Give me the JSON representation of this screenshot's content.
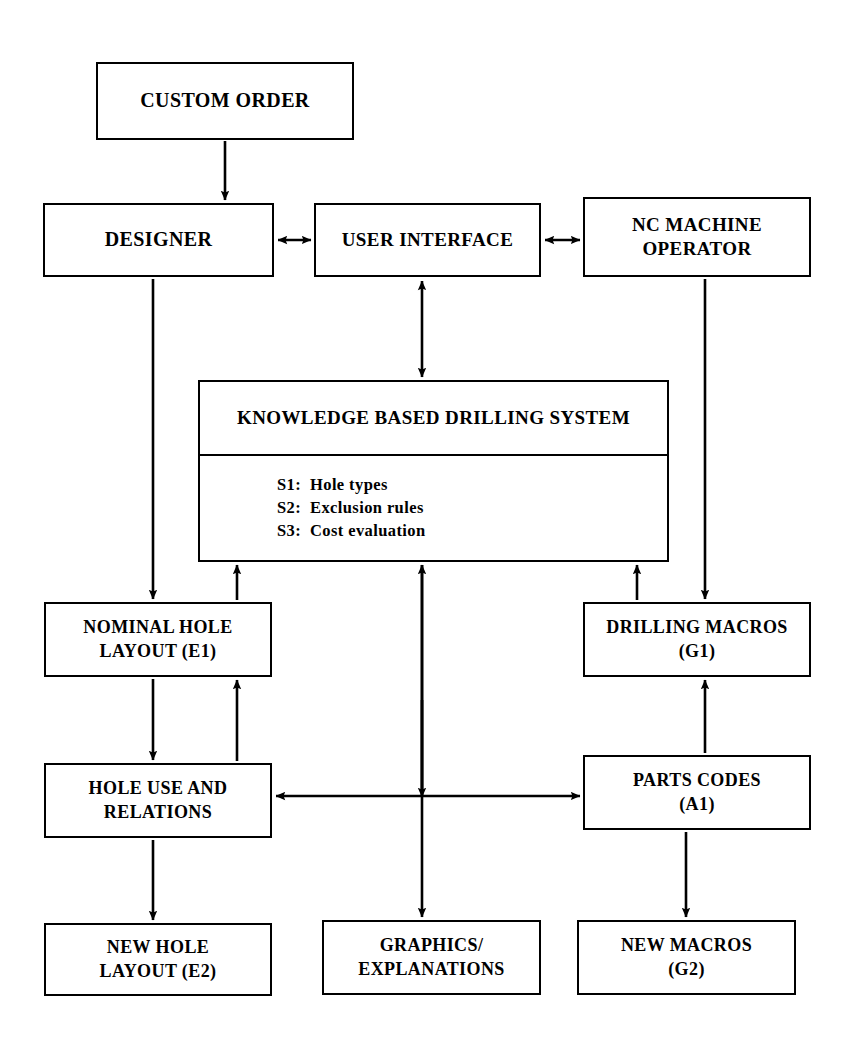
{
  "diagram": {
    "stroke_color": "#000000",
    "background_color": "#ffffff",
    "nodes": {
      "custom_order": {
        "label": "CUSTOM ORDER"
      },
      "designer": {
        "label": "DESIGNER"
      },
      "user_interface": {
        "label": "USER INTERFACE"
      },
      "nc_machine_operator": {
        "line1": "NC MACHINE",
        "line2": "OPERATOR"
      },
      "knowledge_system": {
        "title": "KNOWLEDGE BASED DRILLING SYSTEM",
        "items": [
          {
            "key": "S1:",
            "value": "Hole types"
          },
          {
            "key": "S2:",
            "value": "Exclusion rules"
          },
          {
            "key": "S3:",
            "value": "Cost evaluation"
          }
        ]
      },
      "nominal_hole_layout": {
        "line1": "NOMINAL HOLE",
        "line2": "LAYOUT (E1)"
      },
      "drilling_macros": {
        "line1": "DRILLING MACROS",
        "line2": "(G1)"
      },
      "hole_use_and_relations": {
        "line1": "HOLE USE AND",
        "line2": "RELATIONS"
      },
      "parts_codes": {
        "line1": "PARTS CODES",
        "line2": "(A1)"
      },
      "new_hole_layout": {
        "line1": "NEW HOLE",
        "line2": "LAYOUT (E2)"
      },
      "graphics_explanations": {
        "line1": "GRAPHICS/",
        "line2": "EXPLANATIONS"
      },
      "new_macros": {
        "line1": "NEW MACROS",
        "line2": "(G2)"
      }
    },
    "connections": [
      {
        "name": "custom-order-to-designer",
        "from": "custom_order",
        "to": "designer",
        "arrows": "single"
      },
      {
        "name": "designer-to-user-interface",
        "from": "designer",
        "to": "user_interface",
        "arrows": "double"
      },
      {
        "name": "user-interface-to-nc-operator",
        "from": "user_interface",
        "to": "nc_machine_operator",
        "arrows": "double"
      },
      {
        "name": "user-interface-to-knowledge-system",
        "from": "user_interface",
        "to": "knowledge_system",
        "arrows": "double"
      },
      {
        "name": "designer-to-nominal-hole-layout",
        "from": "designer",
        "to": "nominal_hole_layout",
        "arrows": "single"
      },
      {
        "name": "nc-operator-to-drilling-macros",
        "from": "nc_machine_operator",
        "to": "drilling_macros",
        "arrows": "single"
      },
      {
        "name": "nominal-hole-layout-to-knowledge-system",
        "from": "nominal_hole_layout",
        "to": "knowledge_system",
        "arrows": "single"
      },
      {
        "name": "drilling-macros-to-knowledge-system",
        "from": "drilling_macros",
        "to": "knowledge_system",
        "arrows": "single"
      },
      {
        "name": "nominal-hole-layout-to-hole-use",
        "from": "nominal_hole_layout",
        "to": "hole_use_and_relations",
        "arrows": "single"
      },
      {
        "name": "hole-use-to-nominal-hole-layout",
        "from": "hole_use_and_relations",
        "to": "nominal_hole_layout",
        "arrows": "single"
      },
      {
        "name": "parts-codes-to-drilling-macros",
        "from": "parts_codes",
        "to": "drilling_macros",
        "arrows": "single"
      },
      {
        "name": "hole-use-to-parts-codes",
        "from": "hole_use_and_relations",
        "to": "parts_codes",
        "arrows": "double"
      },
      {
        "name": "knowledge-system-to-graphics",
        "from": "knowledge_system",
        "to": "graphics_explanations",
        "arrows": "double"
      },
      {
        "name": "hole-use-to-new-hole-layout",
        "from": "hole_use_and_relations",
        "to": "new_hole_layout",
        "arrows": "single"
      },
      {
        "name": "parts-codes-to-new-macros",
        "from": "parts_codes",
        "to": "new_macros",
        "arrows": "single"
      }
    ]
  }
}
